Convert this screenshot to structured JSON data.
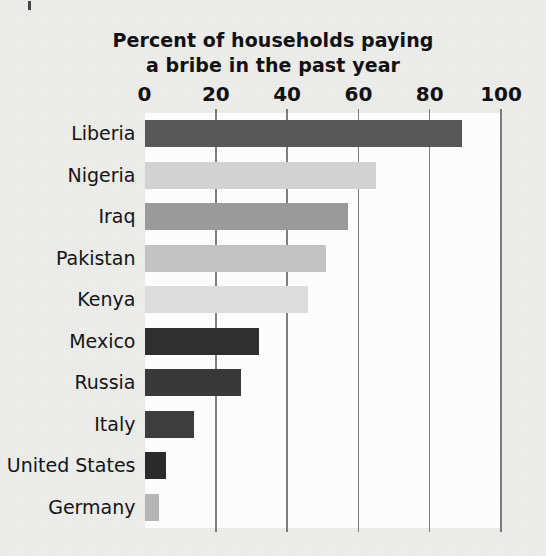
{
  "chart_data": {
    "type": "bar",
    "orientation": "horizontal",
    "title": "Percent of households paying a bribe in the past year",
    "title_line1": "Percent of households paying",
    "title_line2": "a bribe in the past year",
    "xlabel": "",
    "ylabel": "",
    "xlim": [
      0,
      100
    ],
    "xticks": [
      0,
      20,
      40,
      60,
      80,
      100
    ],
    "xtick_labels": [
      "0",
      "20",
      "40",
      "60",
      "80",
      "100"
    ],
    "grid": "vertical",
    "legend": "none",
    "categories": [
      "Liberia",
      "Nigeria",
      "Iraq",
      "Pakistan",
      "Kenya",
      "Mexico",
      "Russia",
      "Italy",
      "United States",
      "Germany"
    ],
    "values": [
      89,
      65,
      57,
      51,
      46,
      32,
      27,
      14,
      6,
      4
    ],
    "bar_colors": [
      "#575757",
      "#d2d2d2",
      "#9a9a9a",
      "#c2c2c2",
      "#dcdcdc",
      "#2f2f2f",
      "#393939",
      "#3d3d3d",
      "#2b2b2b",
      "#b5b5b5"
    ],
    "bars": [
      {
        "label": "Liberia",
        "value": 89,
        "color": "#575757"
      },
      {
        "label": "Nigeria",
        "value": 65,
        "color": "#d2d2d2"
      },
      {
        "label": "Iraq",
        "value": 57,
        "color": "#9a9a9a"
      },
      {
        "label": "Pakistan",
        "value": 51,
        "color": "#c2c2c2"
      },
      {
        "label": "Kenya",
        "value": 46,
        "color": "#dcdcdc"
      },
      {
        "label": "Mexico",
        "value": 32,
        "color": "#2f2f2f"
      },
      {
        "label": "Russia",
        "value": 27,
        "color": "#393939"
      },
      {
        "label": "Italy",
        "value": 14,
        "color": "#3d3d3d"
      },
      {
        "label": "United States",
        "value": 6,
        "color": "#2b2b2b"
      },
      {
        "label": "Germany",
        "value": 4,
        "color": "#b5b5b5"
      }
    ]
  },
  "colors": {
    "page_background": "#ededeb",
    "plot_background": "#fcfcfc",
    "gridline": "#5f5f5f",
    "text": "#111111"
  }
}
